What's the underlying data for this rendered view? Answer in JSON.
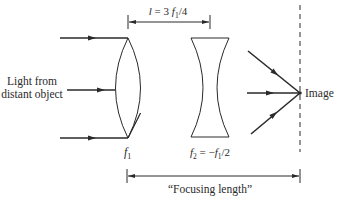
{
  "diagram": {
    "type": "optics-ray-diagram",
    "source_label": {
      "line1": "Light from",
      "line2": "distant object"
    },
    "lens1": {
      "kind": "converging",
      "label_symbol": "f",
      "label_sub": "1"
    },
    "lens2": {
      "kind": "diverging",
      "label_f": "f",
      "label_sub2": "2",
      "label_eq": " = −",
      "label_f1": "f",
      "label_sub1": "1",
      "label_tail": "/2"
    },
    "separation": {
      "label_l": "l",
      "label_eq": " = 3 ",
      "label_f": "f",
      "label_sub": "1",
      "label_tail": "/4"
    },
    "image_label": "Image",
    "focusing_length_label": "“Focusing length”",
    "colors": {
      "ink": "#2a2a2a",
      "background": "#ffffff"
    }
  }
}
